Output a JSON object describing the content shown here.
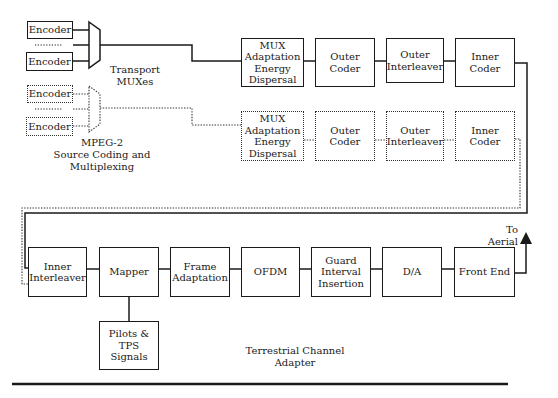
{
  "figure": {
    "encoders_solid": [
      "Encoder",
      "Encoder"
    ],
    "encoders_dashed": [
      "Encoder",
      "Encoder"
    ],
    "labels": {
      "transport_muxes": "Transport\nMUXes",
      "mpeg2": "MPEG-2\nSource Coding and Multiplexing",
      "to_aerial": "To Aerial",
      "terrestrial_channel_adapter": "Terrestrial Channel Adapter"
    },
    "row1": [
      {
        "id": "mux-adaptation",
        "label": "MUX\nAdaptation\nEnergy\nDispersal"
      },
      {
        "id": "outer-coder",
        "label": "Outer\nCoder"
      },
      {
        "id": "outer-interleaver",
        "label": "Outer\nInterleaver"
      },
      {
        "id": "inner-coder",
        "label": "Inner\nCoder"
      }
    ],
    "row2": [
      {
        "id": "mux-adaptation",
        "label": "MUX\nAdaptation\nEnergy\nDispersal"
      },
      {
        "id": "outer-coder",
        "label": "Outer\nCoder"
      },
      {
        "id": "outer-interleaver",
        "label": "Outer\nInterleaver"
      },
      {
        "id": "inner-coder",
        "label": "Inner\nCoder"
      }
    ],
    "row3": [
      {
        "id": "inner-interleaver",
        "label": "Inner\nInterleaver"
      },
      {
        "id": "mapper",
        "label": "Mapper"
      },
      {
        "id": "frame-adaptation",
        "label": "Frame\nAdaptation"
      },
      {
        "id": "ofdm",
        "label": "OFDM"
      },
      {
        "id": "guard-interval",
        "label": "Guard\nInterval\nInsertion"
      },
      {
        "id": "da",
        "label": "D/A"
      },
      {
        "id": "front-end",
        "label": "Front End"
      }
    ],
    "pilots": {
      "label": "Pilots &\nTPS\nSignals"
    },
    "colors": {
      "line": "#1a1a1a",
      "dashed": "#333333",
      "background": "#ffffff"
    }
  }
}
